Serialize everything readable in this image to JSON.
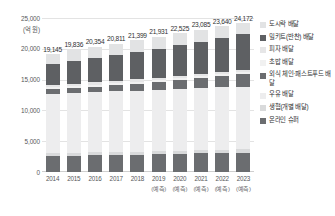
{
  "chart_data": {
    "type": "bar",
    "stacked": true,
    "title": "",
    "xlabel": "",
    "ylabel": "(억 원)",
    "ylim": [
      0,
      25000
    ],
    "yticks": [
      "0",
      "5,000",
      "10,000",
      "15,000",
      "20,000",
      "25,000"
    ],
    "ytick_values": [
      0,
      5000,
      10000,
      15000,
      20000,
      25000
    ],
    "grid": true,
    "legend_position": "right",
    "categories": [
      "2014",
      "2015",
      "2016",
      "2017",
      "2018",
      "2019",
      "2020",
      "2021",
      "2022",
      "2023"
    ],
    "category_notes": [
      "",
      "",
      "",
      "",
      "",
      "(예측)",
      "(예측)",
      "(예측)",
      "(예측)",
      "(예측)"
    ],
    "totals": [
      19145,
      19836,
      20354,
      20811,
      21399,
      21931,
      22525,
      23085,
      23640,
      24172
    ],
    "total_labels": [
      "19,145",
      "19,836",
      "20,354",
      "20,811",
      "21,399",
      "21,931",
      "22,525",
      "23,085",
      "23,640",
      "24,172"
    ],
    "series": [
      {
        "name": "온라인 슈퍼",
        "color": "#6b6d70",
        "values": [
          2550,
          2620,
          2680,
          2740,
          2800,
          2860,
          2930,
          3000,
          3060,
          3130
        ]
      },
      {
        "name": "생협(개별 배달)",
        "color": "#d9dadb",
        "values": [
          480,
          490,
          500,
          510,
          520,
          530,
          540,
          550,
          560,
          570
        ]
      },
      {
        "name": "우유 배달",
        "color": "#ededee",
        "values": [
          9700,
          9750,
          9800,
          9850,
          9900,
          9950,
          10000,
          10050,
          10100,
          10150
        ]
      },
      {
        "name": "외식 체인·패스트푸드 배달",
        "color": "#6b6d70",
        "values": [
          760,
          820,
          880,
          960,
          1090,
          1240,
          1420,
          1600,
          1790,
          1980
        ]
      },
      {
        "name": "초밥 배달",
        "color": "#f1f1f1",
        "values": [
          300,
          310,
          320,
          330,
          340,
          350,
          360,
          370,
          380,
          390
        ]
      },
      {
        "name": "피자 배달",
        "color": "#e6e6e7",
        "values": [
          330,
          340,
          350,
          360,
          370,
          380,
          390,
          400,
          410,
          420
        ]
      },
      {
        "name": "밀키트(반찬) 배달",
        "color": "#5e6063",
        "values": [
          3400,
          3760,
          3980,
          4200,
          4480,
          4690,
          4940,
          5210,
          5460,
          5690
        ]
      },
      {
        "name": "도시락 배달",
        "color": "#e2e3e4",
        "values": [
          1625,
          1746,
          1844,
          1861,
          1899,
          1931,
          1945,
          1905,
          1880,
          1842
        ]
      }
    ]
  },
  "legend": {
    "items": [
      {
        "label": "도시락 배달",
        "color": "#e2e3e4",
        "has_swatch": true
      },
      {
        "label": "밀키트(반찬) 배달",
        "color": "#5e6063",
        "has_swatch": true
      },
      {
        "label": "피자 배달",
        "color": "#e6e6e7",
        "has_swatch": false
      },
      {
        "label": "초밥 배달",
        "color": "#f1f1f1",
        "has_swatch": false
      },
      {
        "label": "외식 체인·패스트푸드 배달",
        "color": "#6b6d70",
        "has_swatch": true
      },
      {
        "label": "우유 배달",
        "color": "#ededee",
        "has_swatch": false
      },
      {
        "label": "생협(개별 배달)",
        "color": "#d9dadb",
        "has_swatch": true
      },
      {
        "label": "온라인 슈퍼",
        "color": "#6b6d70",
        "has_swatch": true
      }
    ]
  }
}
